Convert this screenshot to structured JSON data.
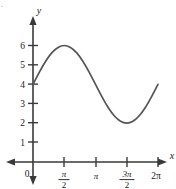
{
  "figure": {
    "marker_text": ".",
    "background_color": "#ffffff",
    "axis_color": "#3a3a3a",
    "curve_color": "#555555",
    "text_color": "#1a1a1a"
  },
  "axes": {
    "x_axis_label": "x",
    "y_axis_label": "y",
    "origin_label": "0"
  },
  "chart_data": {
    "type": "line",
    "title": "",
    "xlabel": "x",
    "ylabel": "y",
    "grid": false,
    "legend": "none",
    "xlim": [
      0,
      6.283185307179586
    ],
    "ylim": [
      0,
      6.6
    ],
    "xtick_values": [
      1.5707963267948966,
      3.141592653589793,
      4.71238898038469,
      6.283185307179586
    ],
    "xtick_labels": [
      "π/2",
      "π",
      "3π/2",
      "2π"
    ],
    "xtick_label_parts": [
      {
        "type": "fraction",
        "numerator": "π",
        "denominator": "2"
      },
      {
        "type": "plain",
        "text": "π"
      },
      {
        "type": "fraction",
        "numerator": "3π",
        "denominator": "2"
      },
      {
        "type": "plain",
        "text": "2π"
      }
    ],
    "ytick_values": [
      1,
      2,
      3,
      4,
      5,
      6
    ],
    "ytick_labels": [
      "1",
      "2",
      "3",
      "4",
      "5",
      "6"
    ],
    "series": [
      {
        "name": "y = 4 + 2 sin(x)",
        "equation": "y = 4 + 2 sin(x)",
        "amplitude": 2,
        "midline": 4,
        "period": 6.283185307179586,
        "x": [
          0,
          0.3141592653589793,
          0.6283185307179586,
          0.9424777960769379,
          1.2566370614359172,
          1.5707963267948966,
          1.8849555921538759,
          2.199114857512855,
          2.5132741228718345,
          2.827433388230814,
          3.141592653589793,
          3.455751918948773,
          3.7699111843077517,
          4.084070449666731,
          4.39822971502571,
          4.71238898038469,
          5.026548245743669,
          5.340707511102648,
          5.654866776461628,
          5.969026041820607,
          6.283185307179586
        ],
        "y": [
          4.0,
          4.62,
          5.18,
          5.62,
          5.9,
          6.0,
          5.9,
          5.62,
          5.18,
          4.62,
          4.0,
          3.38,
          2.82,
          2.38,
          2.1,
          2.0,
          2.1,
          2.38,
          2.82,
          3.38,
          4.0
        ]
      }
    ],
    "key_points": [
      {
        "label": "start",
        "x": 0,
        "y": 4
      },
      {
        "label": "maximum",
        "x": 1.5707963267948966,
        "y": 6
      },
      {
        "label": "midline-crossing",
        "x": 3.141592653589793,
        "y": 4
      },
      {
        "label": "minimum",
        "x": 4.71238898038469,
        "y": 2
      },
      {
        "label": "end",
        "x": 6.283185307179586,
        "y": 4
      }
    ]
  }
}
